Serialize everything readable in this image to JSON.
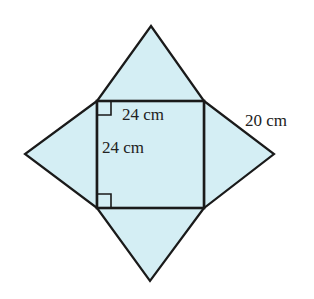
{
  "figure": {
    "fill_color": "#d4eef4",
    "stroke_color": "#1a1a1a",
    "square": {
      "x1": 97,
      "y1": 101,
      "x2": 204,
      "y2": 208
    },
    "apexes": {
      "top": [
        151,
        26
      ],
      "bottom": [
        150,
        281
      ],
      "left": [
        25,
        154
      ],
      "right": [
        274,
        154
      ]
    },
    "labels": {
      "base_top": "24 cm",
      "base_side": "24 cm",
      "slant_edge": "20 cm"
    }
  }
}
